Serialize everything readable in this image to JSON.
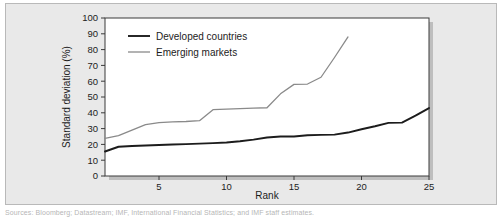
{
  "figure": {
    "background_color": "#e9e9e9",
    "plot_background_color": "#ffffff",
    "border_color": "#b9b9b9",
    "shadow_color": "#9a9a9a",
    "caption_text": "Sources: Bloomberg; Datastream; IMF, International Financial Statistics; and IMF staff estimates."
  },
  "chart_data": {
    "type": "line",
    "title": "",
    "subtitle": "",
    "xlabel": "Rank",
    "ylabel": "Standard deviation (%)",
    "xlim": [
      1,
      25
    ],
    "ylim": [
      0,
      100
    ],
    "xticks": [
      5,
      10,
      15,
      20,
      25
    ],
    "xtick_labels": [
      "5",
      "10",
      "15",
      "20",
      "25"
    ],
    "yticks": [
      0,
      10,
      20,
      30,
      40,
      50,
      60,
      70,
      80,
      90,
      100
    ],
    "ytick_labels": [
      "0",
      "10",
      "20",
      "30",
      "40",
      "50",
      "60",
      "70",
      "80",
      "90",
      "100"
    ],
    "grid": false,
    "legend_position": "top-left",
    "series": [
      {
        "name": "Developed countries",
        "color": "#1c1c1c",
        "line_width": 1.9,
        "x": [
          1,
          2,
          3,
          4,
          5,
          6,
          7,
          8,
          9,
          10,
          11,
          12,
          13,
          14,
          15,
          16,
          17,
          18,
          19,
          20,
          21,
          22,
          23,
          24,
          25
        ],
        "values": [
          15.5,
          18.5,
          19.0,
          19.3,
          19.6,
          19.9,
          20.2,
          20.5,
          20.8,
          21.2,
          22.0,
          23.0,
          24.4,
          25.0,
          25.0,
          25.8,
          26.0,
          26.2,
          27.5,
          29.6,
          31.5,
          33.6,
          33.8,
          38.2,
          43.0
        ]
      },
      {
        "name": "Emerging markets",
        "color": "#8a8a8a",
        "line_width": 1.3,
        "x": [
          1,
          2,
          3,
          4,
          5,
          6,
          7,
          8,
          9,
          10,
          11,
          12,
          13,
          14,
          15,
          16,
          17,
          18,
          19
        ],
        "values": [
          23.8,
          25.5,
          29.0,
          32.5,
          33.8,
          34.3,
          34.5,
          35.0,
          42.0,
          42.3,
          42.6,
          42.9,
          43.2,
          52.0,
          58.0,
          58.2,
          62.5,
          75.0,
          88.0
        ]
      }
    ]
  },
  "legend": {
    "entries": [
      {
        "label": "Developed countries",
        "color": "#1c1c1c"
      },
      {
        "label": "Emerging markets",
        "color": "#8a8a8a"
      }
    ]
  }
}
